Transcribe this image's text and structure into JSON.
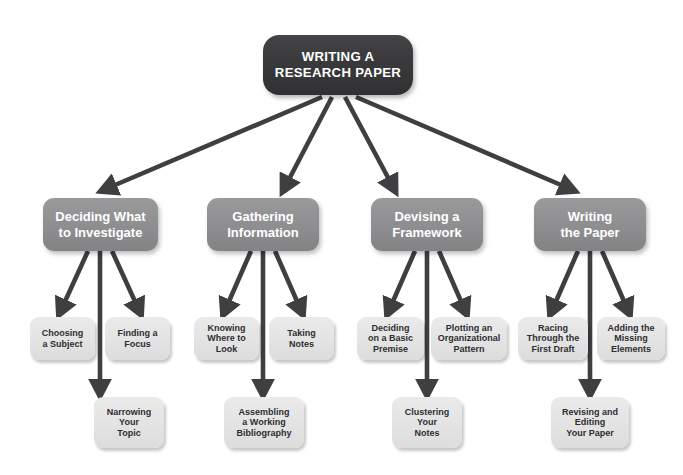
{
  "diagram": {
    "title": "WRITING A RESEARCH PAPER",
    "background_color": "#ffffff",
    "colors": {
      "root_fill": "#3a3a3d",
      "root_text": "#ffffff",
      "branch_fill": "#909092",
      "branch_text": "#ffffff",
      "leaf_fill": "#e4e4e4",
      "leaf_text": "#2e2e30",
      "arrow": "#3f3f42"
    },
    "root": {
      "id": "root",
      "label": "WRITING A\nRESEARCH PAPER"
    },
    "branches": [
      {
        "id": "branch-deciding",
        "label": "Deciding What\nto Investigate",
        "children": [
          {
            "id": "leaf-choosing-a-subject",
            "label": "Choosing\na Subject"
          },
          {
            "id": "leaf-finding-a-focus",
            "label": "Finding a\nFocus"
          },
          {
            "id": "leaf-narrowing-your-topic",
            "label": "Narrowing\nYour\nTopic"
          }
        ]
      },
      {
        "id": "branch-gathering",
        "label": "Gathering\nInformation",
        "children": [
          {
            "id": "leaf-knowing-where-to-look",
            "label": "Knowing\nWhere to\nLook"
          },
          {
            "id": "leaf-taking-notes",
            "label": "Taking\nNotes"
          },
          {
            "id": "leaf-assembling-a-working-bibliography",
            "label": "Assembling\na Working\nBibliography"
          }
        ]
      },
      {
        "id": "branch-devising",
        "label": "Devising a\nFramework",
        "children": [
          {
            "id": "leaf-deciding-on-a-basic-premise",
            "label": "Deciding\non a Basic\nPremise"
          },
          {
            "id": "leaf-plotting-an-organizational-pattern",
            "label": "Plotting an\nOrganizational\nPattern"
          },
          {
            "id": "leaf-clustering-your-notes",
            "label": "Clustering\nYour\nNotes"
          }
        ]
      },
      {
        "id": "branch-writing",
        "label": "Writing\nthe Paper",
        "children": [
          {
            "id": "leaf-racing-through-the-first-draft",
            "label": "Racing\nThrough the\nFirst Draft"
          },
          {
            "id": "leaf-adding-the-missing-elements",
            "label": "Adding the\nMissing\nElements"
          },
          {
            "id": "leaf-revising-and-editing-your-paper",
            "label": "Revising and\nEditing\nYour Paper"
          }
        ]
      }
    ]
  }
}
